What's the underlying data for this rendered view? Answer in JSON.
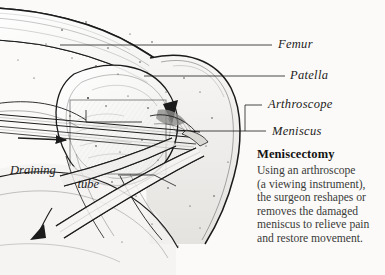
{
  "figure": {
    "title_hidden": "Knee joint sagittal line illustration with arthroscope",
    "background_color": "#fbfaf8",
    "ink_color": "#1b1b1b"
  },
  "labels": {
    "femur": "Femur",
    "patella": "Patella",
    "arthroscope": "Arthroscope",
    "meniscus": "Meniscus",
    "draining_tube_line1": "Draining",
    "draining_tube_line2": "tube"
  },
  "caption": {
    "heading": "Meniscectomy",
    "lines": [
      "Using an arthroscope",
      "(a viewing instrument),",
      "the surgeon reshapes or",
      "removes the damaged",
      "meniscus to relieve pain",
      "and restore movement."
    ]
  },
  "icons": {
    "drain_flow_arrow": "arrow-down-left-icon",
    "scope_insert_arrow": "arrow-right-icon"
  }
}
